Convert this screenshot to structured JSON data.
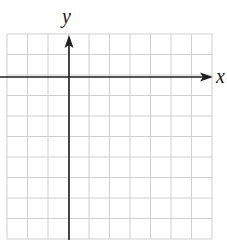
{
  "diagram": {
    "type": "coordinate-plane",
    "x_axis_label": "x",
    "y_axis_label": "y",
    "grid": {
      "columns": 10,
      "rows": 10,
      "left": 7,
      "top": 34,
      "cell": 20.5,
      "line_color": "#cfcfcf"
    },
    "axes": {
      "color": "#1f1f1f",
      "y_axis_x": 69,
      "x_axis_y": 77,
      "x_axis_start": 0,
      "x_axis_end": 213,
      "y_axis_top": 35
    },
    "colors": {
      "background": "#ffffff",
      "grid": "#cfcfcf",
      "axis": "#1f1f1f"
    }
  }
}
